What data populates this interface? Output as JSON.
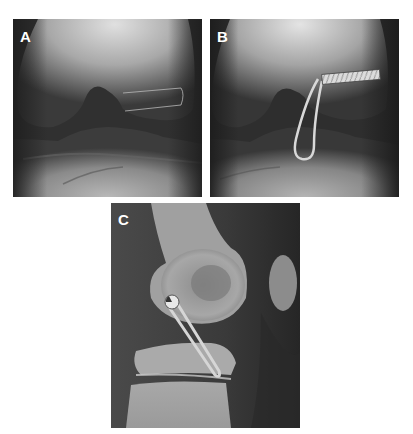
{
  "figure": {
    "panels": [
      {
        "label": "A",
        "view": "AP knee radiograph with outlined tunnel"
      },
      {
        "label": "B",
        "view": "AP knee radiograph with screw and loop implant"
      },
      {
        "label": "C",
        "view": "Lateral knee radiograph with button and loop implant"
      }
    ]
  },
  "colors": {
    "background": "#ffffff",
    "label": "#ffffff"
  }
}
